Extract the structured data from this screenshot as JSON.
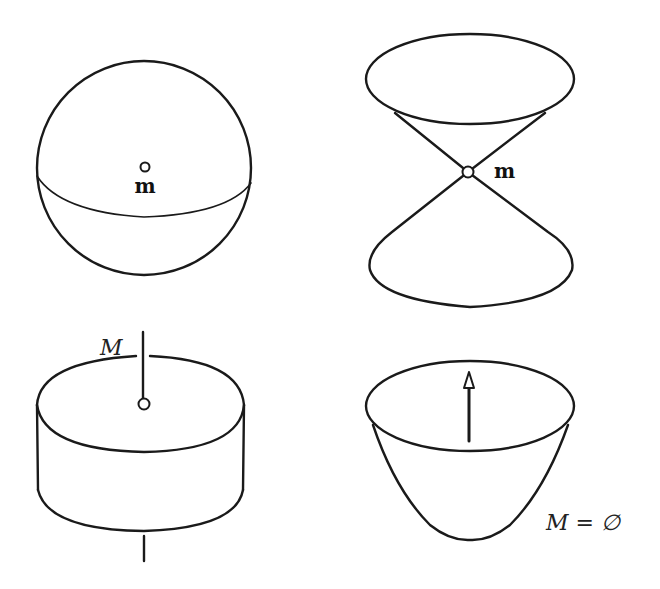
{
  "figure": {
    "panels": [
      {
        "id": "sphere",
        "position": "top-left",
        "shape": "sphere",
        "point_label": "m"
      },
      {
        "id": "double-cone",
        "position": "top-right",
        "shape": "double cone",
        "point_label": "m"
      },
      {
        "id": "cylinder",
        "position": "bottom-left",
        "shape": "cylinder with axis rod",
        "set_label": "M"
      },
      {
        "id": "paraboloid",
        "position": "bottom-right",
        "shape": "paraboloid with upward arrow",
        "set_label": "M = ∅"
      }
    ]
  },
  "colors": {
    "background": "#ffffff",
    "ink": "#1a1a1a"
  }
}
